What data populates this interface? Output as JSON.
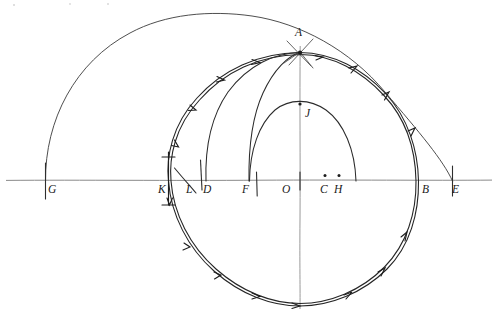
{
  "figure": {
    "background_color": "#ffffff",
    "ink_color": "#1f1f1f",
    "axis_color": "#8a8a8a",
    "width": 498,
    "height": 318
  },
  "axes": {
    "horizontal": {
      "name": "baseline",
      "y": 180,
      "x_start": 6,
      "x_end": 492
    },
    "vertical": {
      "name": "vertical-axis-through-A",
      "x": 300,
      "y_start": 45,
      "y_end": 310
    }
  },
  "labels": [
    {
      "id": "G",
      "text": "G",
      "x": 48,
      "y": 193,
      "point_x": 45,
      "point_y": 180
    },
    {
      "id": "K",
      "text": "K",
      "x": 160,
      "y": 193,
      "point_x": 167,
      "point_y": 180
    },
    {
      "id": "L",
      "text": "L",
      "x": 187,
      "y": 193,
      "point_x": 192,
      "point_y": 180
    },
    {
      "id": "D",
      "text": "D",
      "x": 203,
      "y": 193,
      "point_x": 206,
      "point_y": 180
    },
    {
      "id": "F",
      "text": "F",
      "x": 242,
      "y": 193,
      "point_x": 249,
      "point_y": 180
    },
    {
      "id": "O",
      "text": "O",
      "x": 282,
      "y": 193,
      "point_x": 293,
      "point_y": 180
    },
    {
      "id": "C",
      "text": "C",
      "x": 320,
      "y": 193,
      "point_x": 325,
      "point_y": 176
    },
    {
      "id": "H",
      "text": "H",
      "x": 334,
      "y": 193,
      "point_x": 339,
      "point_y": 176
    },
    {
      "id": "B",
      "text": "B",
      "x": 422,
      "y": 193,
      "point_x": 417,
      "point_y": 180
    },
    {
      "id": "E",
      "text": "E",
      "x": 452,
      "y": 193,
      "point_x": 452,
      "point_y": 180
    },
    {
      "id": "A",
      "text": "A",
      "x": 295,
      "y": 36,
      "point_x": 300,
      "point_y": 52
    },
    {
      "id": "J",
      "text": "J",
      "x": 305,
      "y": 117,
      "point_x": 300,
      "point_y": 104
    }
  ],
  "points": [
    {
      "id": "A",
      "x": 300,
      "y": 52,
      "kind": "intersection"
    },
    {
      "id": "J",
      "x": 300,
      "y": 104,
      "kind": "arc-apex"
    },
    {
      "id": "O",
      "x": 293,
      "y": 180,
      "kind": "center"
    },
    {
      "id": "C",
      "x": 325,
      "y": 176,
      "kind": "dot"
    },
    {
      "id": "H",
      "x": 339,
      "y": 176,
      "kind": "dot"
    },
    {
      "id": "G",
      "x": 45,
      "y": 180,
      "kind": "axis-point"
    },
    {
      "id": "K",
      "x": 167,
      "y": 180,
      "kind": "axis-point"
    },
    {
      "id": "L",
      "x": 192,
      "y": 180,
      "kind": "axis-point"
    },
    {
      "id": "D",
      "x": 206,
      "y": 180,
      "kind": "axis-point"
    },
    {
      "id": "F",
      "x": 249,
      "y": 180,
      "kind": "axis-point"
    },
    {
      "id": "B",
      "x": 417,
      "y": 180,
      "kind": "axis-point"
    },
    {
      "id": "E",
      "x": 452,
      "y": 180,
      "kind": "axis-point"
    }
  ],
  "curves": [
    {
      "id": "outer-semicircle-GE",
      "name": "outer-semicircle",
      "type": "semicircle",
      "from": "G",
      "to": "E",
      "center_x": 248,
      "center_y": 182,
      "radius": 204,
      "description": "Large thin semicircle from G over the top down to E, passing near A"
    },
    {
      "id": "main-circle-KB",
      "name": "main-circle",
      "type": "circle",
      "center_x": 293,
      "center_y": 180,
      "radius": 125,
      "description": "Main circle through K on the left and B on the right, drawn double-stroked with arrow ticks"
    },
    {
      "id": "arc-D-to-A",
      "name": "arc-from-D",
      "type": "arc",
      "from": "D",
      "to": "A",
      "description": "Arc rising from D on the axis up to A"
    },
    {
      "id": "arc-F-to-A",
      "name": "arc-from-F",
      "type": "arc",
      "from": "F",
      "to": "A",
      "description": "Arc rising from F on the axis up to A"
    },
    {
      "id": "inner-semicircle-FH",
      "name": "inner-semicircle",
      "type": "semicircle",
      "from": "F",
      "to": "H",
      "apex": "J",
      "center_x": 294,
      "center_y": 180,
      "radius": 76,
      "description": "Smaller semicircle from F up through J and down toward the right of H"
    }
  ],
  "tick_marks": [
    {
      "id": "tick-K-vertical",
      "name": "tick-at-K",
      "description": "short vertical segment crossing the axis at K"
    },
    {
      "id": "tick-L-diagonal",
      "name": "tick-at-L",
      "description": "short diagonal stroke near L"
    },
    {
      "id": "arrowheads-circle",
      "name": "direction-arrowheads",
      "count": 12,
      "description": "small arrowhead tick marks distributed around the main circle"
    },
    {
      "id": "cross-at-A",
      "name": "cross-at-A",
      "description": "short crossing strokes marking the intersection point A"
    }
  ]
}
